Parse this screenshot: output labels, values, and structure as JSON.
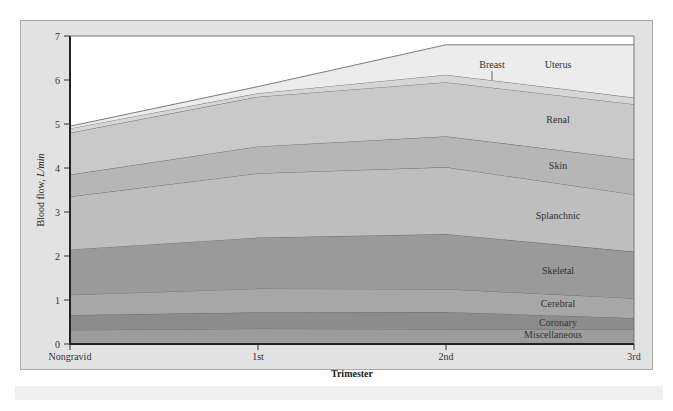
{
  "chart_data": {
    "type": "area",
    "stacked": true,
    "title": "",
    "xlabel": "Trimester",
    "ylabel": "Blood flow, L/min",
    "ylim": [
      0,
      7
    ],
    "yticks": [
      0,
      1,
      2,
      3,
      4,
      5,
      6,
      7
    ],
    "categories": [
      "Nongravid",
      "1st",
      "2nd",
      "3rd"
    ],
    "cumulative_boundaries_note": "values are cumulative top edges of each stacked band (L/min)",
    "series": [
      {
        "name": "Miscellaneous",
        "values": [
          0.32,
          0.35,
          0.34,
          0.34
        ],
        "color": "#9c9c9c"
      },
      {
        "name": "Coronary",
        "values": [
          0.66,
          0.72,
          0.73,
          0.59
        ],
        "color": "#8c8c8c"
      },
      {
        "name": "Cerebral",
        "values": [
          1.12,
          1.26,
          1.25,
          1.04
        ],
        "color": "#a7a7a7"
      },
      {
        "name": "Skeletal",
        "values": [
          2.15,
          2.42,
          2.5,
          2.1
        ],
        "color": "#9a9a9a"
      },
      {
        "name": "Splanchnic",
        "values": [
          3.35,
          3.88,
          4.02,
          3.4
        ],
        "color": "#bebebe"
      },
      {
        "name": "Skin",
        "values": [
          3.85,
          4.49,
          4.72,
          4.2
        ],
        "color": "#b6b6b6"
      },
      {
        "name": "Renal",
        "values": [
          4.8,
          5.62,
          5.95,
          5.45
        ],
        "color": "#c9c9c9"
      },
      {
        "name": "Breast",
        "values": [
          4.9,
          5.7,
          6.12,
          5.6
        ],
        "color": "#d6d6d6"
      },
      {
        "name": "Uterus",
        "values": [
          4.95,
          5.85,
          6.8,
          6.8
        ],
        "color": "#ececec"
      }
    ],
    "legend_position": "inline labels on right side",
    "grid": false
  },
  "labels": {
    "ylabel_main": "Blood flow, ",
    "ylabel_unit": "L/min",
    "xlabel": "Trimester"
  }
}
